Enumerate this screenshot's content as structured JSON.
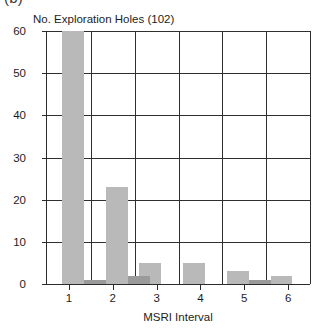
{
  "figure": {
    "panel_label": "(b)",
    "caption_cropped": "(b)",
    "colors": {
      "bar_light": "#b9b9b9",
      "bar_dark": "#9a9a9a",
      "axis": "#2b2b2b",
      "grid": "#2f2f2f",
      "text": "#1d1d1d",
      "background": "#ffffff"
    }
  },
  "chart_data": {
    "type": "bar",
    "title": "No. Exploration Holes (102)",
    "subtitle": "",
    "xlabel": "MSRI Interval",
    "ylabel": "",
    "xlim": [
      0.5,
      6.5
    ],
    "ylim": [
      0,
      60
    ],
    "grid": true,
    "legend": "none",
    "yticks": [
      0,
      10,
      20,
      30,
      40,
      50,
      60
    ],
    "ytick_labels": [
      "0",
      "10",
      "20",
      "30",
      "40",
      "50",
      "60"
    ],
    "xticks": [
      1,
      2,
      3,
      4,
      5,
      6
    ],
    "xtick_labels": [
      "1",
      "2",
      "3",
      "4",
      "5",
      "6"
    ],
    "series": [
      {
        "name": "No. Exploration Holes",
        "color": "#b9b9b9",
        "bars": [
          {
            "x0": 0.85,
            "x1": 1.35,
            "value": 60,
            "label": "60"
          },
          {
            "x0": 1.85,
            "x1": 2.35,
            "value": 23,
            "label": "23"
          },
          {
            "x0": 2.6,
            "x1": 3.1,
            "value": 5,
            "label": "5"
          },
          {
            "x0": 3.6,
            "x1": 4.1,
            "value": 5,
            "label": "5"
          },
          {
            "x0": 4.6,
            "x1": 5.1,
            "value": 3,
            "label": "3"
          },
          {
            "x0": 5.6,
            "x1": 6.1,
            "value": 2,
            "label": "2"
          }
        ]
      },
      {
        "name": "Low overlay counts",
        "color": "#9a9a9a",
        "bars": [
          {
            "x0": 1.35,
            "x1": 1.85,
            "value": 1,
            "label": "1"
          },
          {
            "x0": 2.35,
            "x1": 2.6,
            "value": 2,
            "label": "2"
          },
          {
            "x0": 2.35,
            "x1": 2.85,
            "value": 2,
            "label": "2"
          },
          {
            "x0": 5.1,
            "x1": 5.6,
            "value": 1,
            "label": "1"
          }
        ]
      }
    ]
  },
  "axis_title": {
    "x": "MSRI Interval"
  }
}
